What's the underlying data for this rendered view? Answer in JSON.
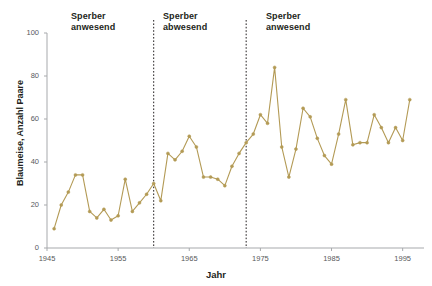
{
  "chart_data": {
    "type": "line",
    "title": "",
    "xlabel": "Jahr",
    "ylabel": "Blaumeise, Anzahl Paare",
    "xlim": [
      1945,
      1998
    ],
    "ylim": [
      0,
      100
    ],
    "xticks": [
      1945,
      1955,
      1965,
      1975,
      1985,
      1995
    ],
    "yticks": [
      0,
      20,
      40,
      60,
      80,
      100
    ],
    "grid": false,
    "legend": "none",
    "line_color": "#b39a55",
    "marker": "circle",
    "marker_color": "#b39a55",
    "series": [
      {
        "name": "Blaumeise, Anzahl Paare",
        "x": [
          1946,
          1947,
          1948,
          1949,
          1950,
          1951,
          1952,
          1953,
          1954,
          1955,
          1956,
          1957,
          1958,
          1959,
          1960,
          1961,
          1962,
          1963,
          1964,
          1965,
          1966,
          1967,
          1968,
          1969,
          1970,
          1971,
          1972,
          1973,
          1974,
          1975,
          1976,
          1977,
          1978,
          1979,
          1980,
          1981,
          1982,
          1983,
          1984,
          1985,
          1986,
          1987,
          1988,
          1989,
          1990,
          1991,
          1992,
          1993,
          1994,
          1995,
          1996
        ],
        "values": [
          9,
          20,
          26,
          34,
          34,
          17,
          14,
          18,
          13,
          15,
          32,
          17,
          21,
          25,
          30,
          22,
          44,
          41,
          45,
          52,
          47,
          33,
          33,
          32,
          29,
          38,
          44,
          49,
          53,
          62,
          58,
          84,
          47,
          33,
          46,
          65,
          61,
          51,
          43,
          39,
          53,
          69,
          48,
          49,
          49,
          62,
          56,
          49,
          56,
          50,
          69
        ]
      }
    ],
    "annotations": [
      {
        "id": "ann-0",
        "text": "Sperber\nanwesend",
        "x_start": 1945,
        "x_end": 1960
      },
      {
        "id": "ann-1",
        "text": "Sperber\nabwesend",
        "x_start": 1960,
        "x_end": 1973
      },
      {
        "id": "ann-2",
        "text": "Sperber\nanwesend",
        "x_start": 1973,
        "x_end": 1998
      }
    ],
    "vlines": [
      {
        "x": 1960,
        "style": "dotted",
        "color": "#231f20"
      },
      {
        "x": 1973,
        "style": "dotted",
        "color": "#231f20"
      }
    ]
  },
  "axis": {
    "ylabel": "Blaumeise, Anzahl Paare",
    "xlabel": "Jahr",
    "yticks": [
      "0",
      "20",
      "40",
      "60",
      "80",
      "100"
    ],
    "xticks": [
      "1945",
      "1955",
      "1965",
      "1975",
      "1985",
      "1995"
    ]
  },
  "annotations": {
    "period1": "Sperber\nanwesend",
    "period2": "Sperber\nabwesend",
    "period3": "Sperber\nanwesend"
  }
}
